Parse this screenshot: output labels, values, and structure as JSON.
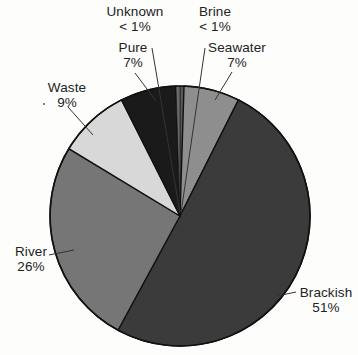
{
  "chart_data": {
    "type": "pie",
    "title": "",
    "subtitle": "",
    "xlabel": "",
    "ylabel": "",
    "legend_position": "none",
    "grid": false,
    "labels_on_slices": false,
    "label_placement": "outside-with-leader-lines",
    "start_angle_deg": 0,
    "direction": "clockwise",
    "categories": [
      "Brine",
      "Seawater",
      "Brackish",
      "River",
      "Waste",
      "Pure",
      "Unknown"
    ],
    "values": [
      0.5,
      7,
      51,
      26,
      9,
      7,
      0.5
    ],
    "value_texts": [
      "< 1%",
      "7%",
      "51%",
      "26%",
      "9%",
      "7%",
      "< 1%"
    ],
    "colors": [
      "#5a5a5a",
      "#8e8e8e",
      "#3b3b3b",
      "#767676",
      "#d8d8d8",
      "#1a1a1a",
      "#6a6a6a"
    ],
    "slices": [
      {
        "name": "Brine",
        "value": 0.5,
        "value_text": "< 1%",
        "color": "#5a5a5a"
      },
      {
        "name": "Seawater",
        "value": 7,
        "value_text": "7%",
        "color": "#8e8e8e"
      },
      {
        "name": "Brackish",
        "value": 51,
        "value_text": "51%",
        "color": "#3b3b3b"
      },
      {
        "name": "River",
        "value": 26,
        "value_text": "26%",
        "color": "#767676"
      },
      {
        "name": "Waste",
        "value": 9,
        "value_text": "9%",
        "color": "#d8d8d8"
      },
      {
        "name": "Pure",
        "value": 7,
        "value_text": "7%",
        "color": "#1a1a1a"
      },
      {
        "name": "Unknown",
        "value": 0.5,
        "value_text": "< 1%",
        "color": "#6a6a6a"
      }
    ]
  },
  "labels": {
    "unknown": {
      "name": "Unknown",
      "pct": "< 1%"
    },
    "brine": {
      "name": "Brine",
      "pct": "< 1%"
    },
    "pure": {
      "name": "Pure",
      "pct": "7%"
    },
    "seawater": {
      "name": "Seawater",
      "pct": "7%"
    },
    "waste": {
      "name": "Waste",
      "pct": "9%"
    },
    "river": {
      "name": "River",
      "pct": "26%"
    },
    "brackish": {
      "name": "Brackish",
      "pct": "51%"
    }
  },
  "style": {
    "background": "#fdfdfb",
    "text_color": "#222222",
    "outline_color": "#111111"
  }
}
